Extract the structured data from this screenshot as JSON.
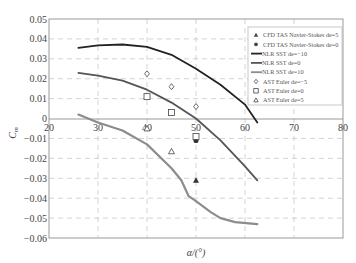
{
  "chart_data": {
    "type": "line",
    "title": "",
    "xlabel": "α/(°)",
    "ylabel": "C_m",
    "xlim": [
      20,
      80
    ],
    "ylim": [
      -0.06,
      0.05
    ],
    "x_ticks": [
      "20",
      "30",
      "40",
      "50",
      "60",
      "70",
      "80"
    ],
    "y_ticks": [
      "0.05",
      "0.04",
      "0.03",
      "0.02",
      "0.01",
      "0",
      "-0.01",
      "-0.02",
      "-0.03",
      "-0.04",
      "-0.05",
      "-0.06"
    ],
    "grid": true,
    "legend_position": "upper right",
    "series": [
      {
        "name": "CFD TAS Navier-Stokes de=5",
        "kind": "marker",
        "marker": "filled-triangle",
        "color": "#333333",
        "x": [
          50
        ],
        "y": [
          -0.031
        ]
      },
      {
        "name": "CFD TAS Navier-Stokes de=0",
        "kind": "marker",
        "marker": "filled-circle",
        "color": "#333333",
        "x": [
          50
        ],
        "y": [
          -0.011
        ]
      },
      {
        "name": "NLR SST de=-10",
        "kind": "line",
        "color": "#222222",
        "width": 1.8,
        "x": [
          26,
          30,
          35,
          40,
          45,
          50,
          55,
          60,
          62.5
        ],
        "y": [
          0.0355,
          0.0368,
          0.0372,
          0.036,
          0.032,
          0.025,
          0.017,
          0.007,
          -0.002
        ]
      },
      {
        "name": "NLR SST de=0",
        "kind": "line",
        "color": "#555555",
        "width": 1.8,
        "x": [
          26,
          30,
          35,
          40,
          45,
          50,
          55,
          60,
          62.5
        ],
        "y": [
          0.023,
          0.0215,
          0.019,
          0.0145,
          0.008,
          0.0,
          -0.011,
          -0.024,
          -0.031
        ]
      },
      {
        "name": "NLR SST de=10",
        "kind": "line",
        "color": "#8c8c8c",
        "width": 2.2,
        "x": [
          26,
          28,
          30,
          35,
          40,
          45,
          47,
          48.5,
          50,
          53,
          55,
          58,
          62.5
        ],
        "y": [
          0.002,
          0.0,
          -0.002,
          -0.006,
          -0.013,
          -0.025,
          -0.031,
          -0.039,
          -0.0415,
          -0.047,
          -0.05,
          -0.052,
          -0.053
        ]
      },
      {
        "name": "AST Euler de=-5",
        "kind": "marker",
        "marker": "open-diamond",
        "color": "#444444",
        "x": [
          40,
          45,
          50
        ],
        "y": [
          0.0225,
          0.016,
          0.006
        ]
      },
      {
        "name": "AST Euler de=0",
        "kind": "marker",
        "marker": "open-square",
        "color": "#444444",
        "x": [
          40,
          45,
          50
        ],
        "y": [
          0.011,
          0.003,
          -0.009
        ]
      },
      {
        "name": "AST Euler de=5",
        "kind": "marker",
        "marker": "open-triangle",
        "color": "#444444",
        "x": [
          40,
          45
        ],
        "y": [
          -0.005,
          -0.0165
        ]
      }
    ]
  },
  "legend": {
    "items": [
      {
        "label": "CFD TAS Navier-Stokes de=5",
        "symbol": "filled-triangle"
      },
      {
        "label": "CFD TAS Navier-Stokes de=0",
        "symbol": "filled-circle"
      },
      {
        "label": "NLR SST de=−10",
        "symbol": "line-black"
      },
      {
        "label": "NLR SST de=0",
        "symbol": "line-dark-gray"
      },
      {
        "label": "NLR SST de=10",
        "symbol": "line-light-gray"
      },
      {
        "label": "AST Euler de=−5",
        "symbol": "open-diamond"
      },
      {
        "label": "AST Euler de=0",
        "symbol": "open-square"
      },
      {
        "label": "AST Euler de=5",
        "symbol": "open-triangle"
      }
    ]
  },
  "axes": {
    "x_label": "α/(°)",
    "y_label": "C",
    "y_label_sub": "m"
  }
}
